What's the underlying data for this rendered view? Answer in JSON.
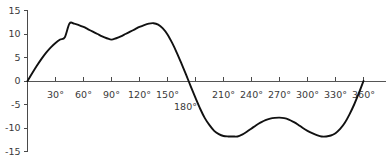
{
  "chart_data": {
    "type": "line",
    "title": "",
    "subtitle": "",
    "xlabel": "",
    "ylabel": "",
    "xlim": [
      0,
      360
    ],
    "ylim": [
      -15,
      15
    ],
    "grid": false,
    "legend": false,
    "legend_position": "none",
    "x_tick_labels": [
      "30°",
      "60°",
      "90°",
      "120°",
      "150°",
      "180°",
      "210°",
      "240°",
      "270°",
      "300°",
      "330°",
      "360°"
    ],
    "x_tick_values": [
      30,
      60,
      90,
      120,
      150,
      180,
      210,
      240,
      270,
      300,
      330,
      360
    ],
    "y_tick_labels": [
      "15",
      "10",
      "5",
      "0",
      "-5",
      "-10",
      "-15"
    ],
    "y_tick_values": [
      15,
      10,
      5,
      0,
      -5,
      -10,
      -15
    ],
    "series": [
      {
        "name": "composite waveform",
        "color": "#111111",
        "x": [
          0,
          5,
          10,
          15,
          20,
          25,
          30,
          35,
          40,
          45,
          50,
          55,
          60,
          65,
          70,
          75,
          80,
          85,
          90,
          95,
          100,
          105,
          110,
          115,
          120,
          125,
          130,
          135,
          140,
          145,
          150,
          155,
          160,
          165,
          170,
          175,
          180,
          185,
          190,
          195,
          200,
          205,
          210,
          215,
          220,
          225,
          230,
          235,
          240,
          245,
          250,
          255,
          260,
          265,
          270,
          275,
          280,
          285,
          290,
          295,
          300,
          305,
          310,
          315,
          320,
          325,
          330,
          335,
          340,
          345,
          350,
          355,
          360
        ],
        "y": [
          0,
          1.65,
          3.24,
          4.71,
          6.04,
          7.17,
          8.1,
          8.82,
          9.32,
          12.24,
          12.2,
          11.9,
          11.5,
          11.0,
          10.5,
          10.0,
          9.5,
          9.1,
          8.8,
          9.1,
          9.5,
          10.0,
          10.5,
          11.0,
          11.5,
          11.9,
          12.2,
          12.3,
          12.0,
          11.2,
          9.9,
          8.1,
          6.0,
          3.7,
          1.3,
          -1.2,
          -3.6,
          -5.9,
          -7.9,
          -9.4,
          -10.6,
          -11.3,
          -11.7,
          -11.8,
          -11.8,
          -11.8,
          -11.4,
          -10.8,
          -10.1,
          -9.4,
          -8.8,
          -8.3,
          -8.0,
          -7.85,
          -7.8,
          -7.9,
          -8.2,
          -8.7,
          -9.3,
          -10.0,
          -10.6,
          -11.1,
          -11.5,
          -11.8,
          -11.8,
          -11.6,
          -11.1,
          -10.2,
          -8.9,
          -7.1,
          -5.0,
          -2.6,
          0
        ]
      }
    ],
    "annotations": []
  },
  "axes": {
    "x_axis_name": "angle-axis",
    "y_axis_name": "value-axis"
  }
}
